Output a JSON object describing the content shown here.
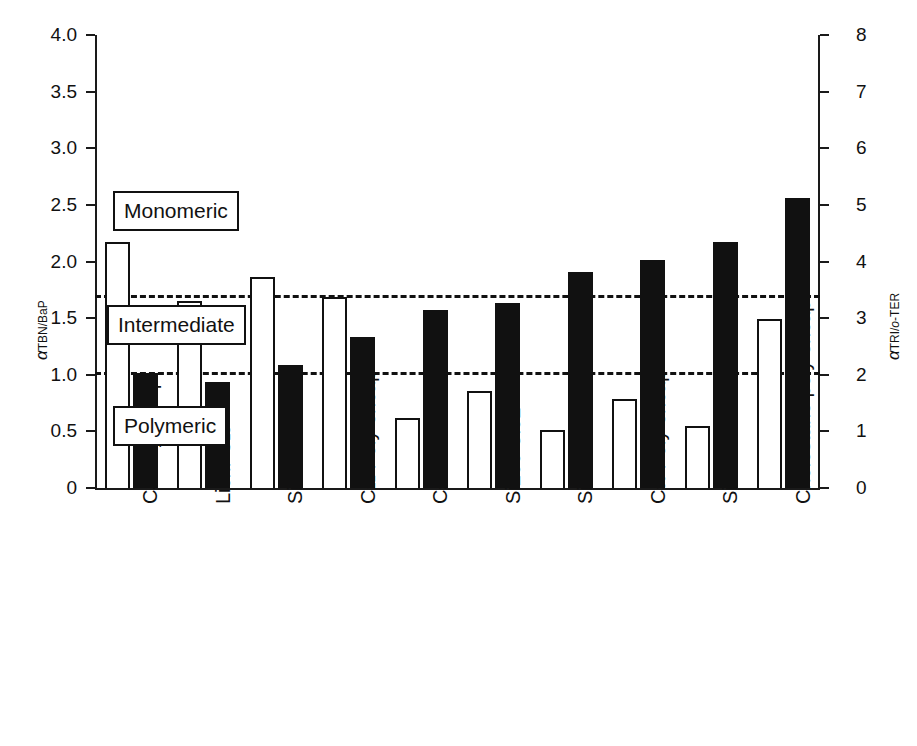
{
  "chart_data": {
    "type": "bar",
    "title": "",
    "xlabel": "",
    "ylabel": "α TBN/BaP",
    "y2label": "α TRI/o-TER",
    "ylim": [
      0,
      4
    ],
    "y2lim": [
      0,
      8
    ],
    "grid": false,
    "legend": "none",
    "categories": [
      "C4 Poly encap",
      "Lichr C18",
      "Si100-2.73",
      "C12 Poly encap",
      "C30 brush",
      "Si200-3.92",
      "Si100-4.91",
      "C30 Poly encap",
      "Si200-6.95",
      "Cholestane poly encap"
    ],
    "series": [
      {
        "name": "alpha TBN/BaP",
        "style": "open",
        "axis": "left",
        "values": [
          2.17,
          1.65,
          1.86,
          1.69,
          0.62,
          0.86,
          0.51,
          0.79,
          0.55,
          1.49
        ]
      },
      {
        "name": "alpha TRI/o-TER",
        "style": "filled",
        "axis": "right",
        "values_left_scale": [
          1.02,
          0.94,
          1.09,
          1.33,
          1.57,
          1.63,
          1.91,
          2.01,
          2.17,
          2.56
        ],
        "values": [
          2.04,
          1.88,
          2.18,
          2.66,
          3.14,
          3.26,
          3.82,
          4.02,
          4.34,
          5.12
        ]
      }
    ],
    "thresholds": [
      {
        "label": "monomeric-intermediate",
        "value_left": 1.7,
        "value_right": 3.4,
        "style": "dashed"
      },
      {
        "label": "intermediate-polymeric",
        "value_left": 1.02,
        "value_right": 2.04,
        "style": "dashed"
      }
    ],
    "yticks_left": [
      "0",
      "0.5",
      "1.0",
      "1.5",
      "2.0",
      "2.5",
      "3.0",
      "3.5",
      "4.0"
    ],
    "yticks_left_values": [
      0,
      0.5,
      1.0,
      1.5,
      2.0,
      2.5,
      3.0,
      3.5,
      4.0
    ],
    "yticks_right": [
      "0",
      "1",
      "2",
      "3",
      "4",
      "5",
      "6",
      "7",
      "8"
    ],
    "yticks_right_values": [
      0,
      1,
      2,
      3,
      4,
      5,
      6,
      7,
      8
    ],
    "region_labels": [
      "Monomeric",
      "Intermediate",
      "Polymeric"
    ]
  },
  "axes": {
    "left": {
      "title_alpha": "α",
      "title_sub": "TBN/BaP",
      "ticks": [
        {
          "label": "4.0",
          "value": 4.0
        },
        {
          "label": "3.5",
          "value": 3.5
        },
        {
          "label": "3.0",
          "value": 3.0
        },
        {
          "label": "2.5",
          "value": 2.5
        },
        {
          "label": "2.0",
          "value": 2.0
        },
        {
          "label": "1.5",
          "value": 1.5
        },
        {
          "label": "1.0",
          "value": 1.0
        },
        {
          "label": "0.5",
          "value": 0.5
        },
        {
          "label": "0",
          "value": 0.0
        }
      ]
    },
    "right": {
      "title_alpha": "α",
      "title_sub_a": "TRI/",
      "title_sub_ital": "o",
      "title_sub_b": "-TER",
      "ticks": [
        {
          "label": "8",
          "value": 8
        },
        {
          "label": "7",
          "value": 7
        },
        {
          "label": "6",
          "value": 6
        },
        {
          "label": "5",
          "value": 5
        },
        {
          "label": "4",
          "value": 4
        },
        {
          "label": "3",
          "value": 3
        },
        {
          "label": "2",
          "value": 2
        },
        {
          "label": "1",
          "value": 1
        },
        {
          "label": "0",
          "value": 0
        }
      ]
    }
  },
  "regions": [
    {
      "name": "monomeric",
      "label": "Monomeric"
    },
    {
      "name": "intermediate",
      "label": "Intermediate"
    },
    {
      "name": "polymeric",
      "label": "Polymeric"
    }
  ],
  "categories": [
    {
      "main": "C",
      "sub": "4",
      "rest": " Poly encap"
    },
    {
      "main": "Lichr C",
      "sub": "18",
      "rest": ""
    },
    {
      "main": "Si100-2.73",
      "sub": "",
      "rest": ""
    },
    {
      "main": "C",
      "sub": "12",
      "rest": " Poly encap"
    },
    {
      "main": "C",
      "sub": "30",
      "rest": " brush"
    },
    {
      "main": "Si200-3.92",
      "sub": "",
      "rest": ""
    },
    {
      "main": "Si100-4.91",
      "sub": "",
      "rest": ""
    },
    {
      "main": "C",
      "sub": "30",
      "rest": " Poly encap"
    },
    {
      "main": "Si200-6.95",
      "sub": "",
      "rest": ""
    },
    {
      "main": "Cholestane poly encap",
      "sub": "",
      "rest": ""
    }
  ],
  "colors": {
    "ink": "#111111",
    "open_bar_fill": "#ffffff",
    "filled_bar": "#111111",
    "background": "#ffffff"
  }
}
